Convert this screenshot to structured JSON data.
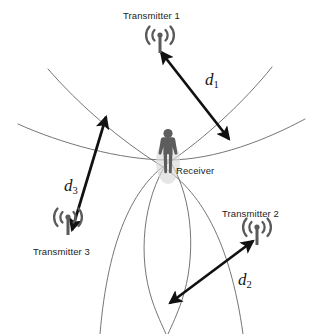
{
  "diagram": {
    "type": "schematic",
    "canvas": {
      "width": 317,
      "height": 334
    },
    "colors": {
      "background": "#ffffff",
      "curve": "#6e6e6e",
      "arrow": "#111111",
      "figure": "#5d5d5d",
      "figure_shadow": "#c9c9c9",
      "label_text": "#1d1d1d",
      "math_text": "#161616"
    }
  },
  "nodes": {
    "transmitter1": {
      "label": "Transmitter 1",
      "icon": "antenna-icon",
      "label_x": 123,
      "label_y": 10,
      "icon_x": 160,
      "icon_y": 42
    },
    "transmitter2": {
      "label": "Transmitter 2",
      "icon": "antenna-icon",
      "label_x": 222,
      "label_y": 208,
      "icon_x": 257,
      "icon_y": 234
    },
    "transmitter3": {
      "label": "Transmitter 3",
      "icon": "antenna-icon",
      "label_x": 33,
      "label_y": 246,
      "icon_x": 68,
      "icon_y": 224
    },
    "receiver": {
      "label": "Receiver",
      "icon": "person-icon",
      "label_x": 176,
      "label_y": 165,
      "icon_x": 168,
      "icon_y": 150
    }
  },
  "distances": [
    {
      "id": "d1",
      "base": "d",
      "sub": "1",
      "from": "transmitter1",
      "to": "receiver",
      "label_x": 205,
      "label_y": 70,
      "arrow": {
        "x1": 161,
        "y1": 52,
        "x2": 229,
        "y2": 139
      }
    },
    {
      "id": "d2",
      "base": "d",
      "sub": "2",
      "from": "transmitter2",
      "to": "receiver",
      "label_x": 238,
      "label_y": 270,
      "arrow": {
        "x1": 253,
        "y1": 241,
        "x2": 170,
        "y2": 303
      }
    },
    {
      "id": "d3",
      "base": "d",
      "sub": "3",
      "from": "transmitter3",
      "to": "receiver",
      "label_x": 64,
      "label_y": 176,
      "arrow": {
        "x1": 72,
        "y1": 230,
        "x2": 106,
        "y2": 117
      }
    }
  ],
  "curves": [
    {
      "name": "hyperbola-horizontal",
      "d": "M 18 124 C 60 143 120 160 168 160 C 216 160 268 139 305 119"
    },
    {
      "name": "hyperbola-upper-left-branch",
      "d": "M 48 69 C 78 104 120 140 160 165 C 200 190 230 240 243 334"
    },
    {
      "name": "hyperbola-upper-right-branch",
      "d": "M 272 67 C 244 102 204 139 168 163 C 134 186 108 238 100 334"
    },
    {
      "name": "hyperbola-lower-lens-left",
      "d": "M 168 161 C 142 200 138 258 152 300 C 157 315 162 325 166 334"
    },
    {
      "name": "hyperbola-lower-lens-right",
      "d": "M 170 161 C 194 200 196 258 182 300 C 177 315 172 325 168 334"
    }
  ]
}
